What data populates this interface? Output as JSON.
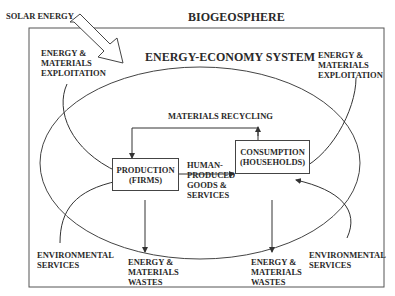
{
  "diagram": {
    "outer_title": "BIOGEOSPHERE",
    "inner_title": "ENERGY-ECONOMY SYSTEM",
    "solar_label": "SOLAR ENERGY",
    "exploitation_left": "ENERGY &\nMATERIALS\nEXPLOITATION",
    "exploitation_right": "ENERGY &\nMATERIALS\nEXPLOITATION",
    "recycling": "MATERIALS RECYCLING",
    "production_box": {
      "line1": "PRODUCTION",
      "line2": "(FIRMS)"
    },
    "consumption_box": {
      "line1": "CONSUMPTION",
      "line2": "(HOUSEHOLDS)"
    },
    "flow_label": "HUMAN-\nPRODUCED\nGOODS &\nSERVICES",
    "env_services_left": "ENVIRONMENTAL\nSERVICES",
    "env_services_right": "ENVIRONMENTAL\nSERVICES",
    "wastes_left": "ENERGY &\nMATERIALS\nWASTES",
    "wastes_right": "ENERGY &\nMATERIALS\nWASTES",
    "line_color": "#444444"
  }
}
